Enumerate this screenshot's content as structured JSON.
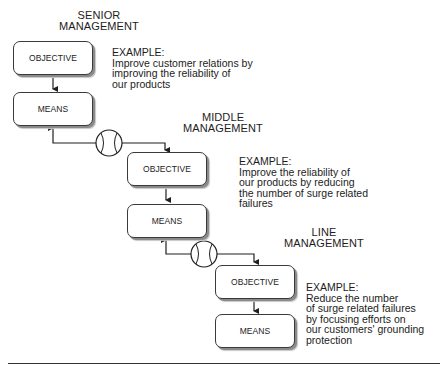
{
  "levels": [
    {
      "heading": [
        "SENIOR",
        "MANAGEMENT"
      ],
      "objective_label": "OBJECTIVE",
      "means_label": "MEANS",
      "example": [
        "EXAMPLE:",
        "Improve customer relations by",
        "improving the reliability of",
        "our products"
      ]
    },
    {
      "heading": [
        "MIDDLE",
        "MANAGEMENT"
      ],
      "objective_label": "OBJECTIVE",
      "means_label": "MEANS",
      "example": [
        "EXAMPLE:",
        "Improve the reliability of",
        "our products by reducing",
        "the number of surge related",
        "failures"
      ]
    },
    {
      "heading": [
        "LINE",
        "MANAGEMENT"
      ],
      "objective_label": "OBJECTIVE",
      "means_label": "MEANS",
      "example": [
        "EXAMPLE:",
        "Reduce the number",
        "of surge related failures",
        "by focusing efforts on",
        "our customers' grounding",
        "protection"
      ]
    }
  ],
  "connectors": [
    {
      "icon": "baseball-icon",
      "from": "senior-means",
      "to": "middle-objective"
    },
    {
      "icon": "baseball-icon",
      "from": "middle-means",
      "to": "line-objective"
    }
  ],
  "colors": {
    "line": "#1f1f1f",
    "box_border": "#3a3a3a",
    "shadow": "#8a8a8a"
  }
}
